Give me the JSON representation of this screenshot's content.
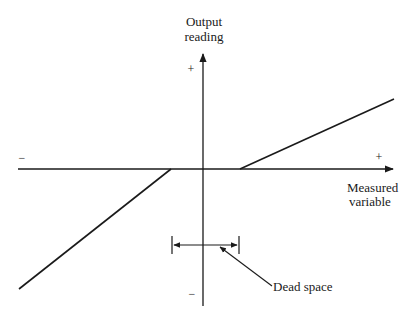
{
  "diagram": {
    "y_axis": {
      "label_line1": "Output",
      "label_line2": "reading",
      "plus": "+",
      "minus": "−"
    },
    "x_axis": {
      "label_line1": "Measured",
      "label_line2": "variable",
      "plus": "+",
      "minus": "−"
    },
    "annotation": {
      "label": "Dead space"
    },
    "colors": {
      "line": "#1a1a1a",
      "background": "#ffffff"
    },
    "geometry": {
      "origin": [
        203,
        169
      ],
      "x_axis_start": [
        18,
        169
      ],
      "x_axis_end": [
        395,
        169
      ],
      "y_axis_top": [
        203,
        52
      ],
      "y_axis_bottom": [
        203,
        306
      ],
      "dead_zone_left": 171,
      "dead_zone_right": 240,
      "upper_segment": [
        [
          240,
          169
        ],
        [
          394,
          99
        ]
      ],
      "lower_segment": [
        [
          171,
          169
        ],
        [
          19,
          289
        ]
      ],
      "dead_space_marker_y": 245,
      "pointer_line": [
        [
          218,
          246
        ],
        [
          272,
          285
        ]
      ]
    }
  }
}
